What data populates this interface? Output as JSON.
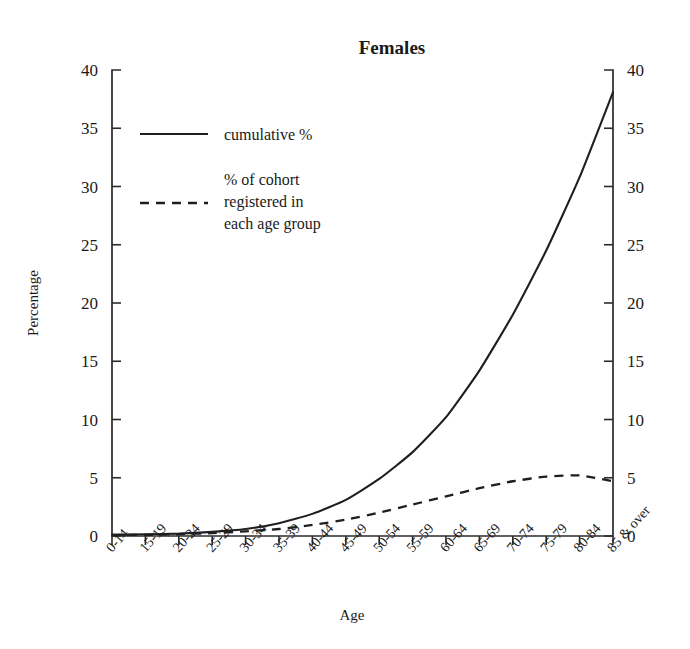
{
  "chart_data": {
    "type": "line",
    "title": "Females",
    "xlabel": "Age",
    "ylabel": "Percentage",
    "ylim": [
      0,
      40
    ],
    "yticks": [
      0,
      5,
      10,
      15,
      20,
      25,
      30,
      35,
      40
    ],
    "ytick_labels": [
      "0",
      "5",
      "10",
      "15",
      "20",
      "25",
      "30",
      "35",
      "40"
    ],
    "grid": false,
    "legend_position": "upper-left-inside",
    "dual_axis": true,
    "right_axis_label": "",
    "right_ytick_labels": [
      "0",
      "5",
      "10",
      "15",
      "20",
      "25",
      "30",
      "35",
      "40"
    ],
    "categories": [
      "0-14",
      "15-19",
      "20-24",
      "25-29",
      "30-34",
      "35-39",
      "40-44",
      "45-49",
      "50-54",
      "55-59",
      "60-64",
      "65-69",
      "70-74",
      "75-79",
      "80-84",
      "85 & over"
    ],
    "series": [
      {
        "name": "cumulative %",
        "style": "solid",
        "values": [
          0.1,
          0.15,
          0.2,
          0.35,
          0.6,
          1.1,
          1.9,
          3.1,
          4.9,
          7.2,
          10.2,
          14.2,
          19.0,
          24.5,
          30.8,
          38.1
        ]
      },
      {
        "name": "% of cohort registered in each age group",
        "style": "dashed",
        "values": [
          0.1,
          0.1,
          0.15,
          0.25,
          0.4,
          0.6,
          0.95,
          1.4,
          2.0,
          2.7,
          3.4,
          4.1,
          4.7,
          5.1,
          5.2,
          4.7
        ]
      }
    ]
  },
  "legend": {
    "entries": [
      {
        "label": "cumulative %",
        "style": "solid"
      },
      {
        "label": "% of cohort\nregistered in\neach age group",
        "style": "dashed"
      }
    ],
    "entry1_label": "cumulative %",
    "entry2_line1": "% of cohort",
    "entry2_line2": "registered in",
    "entry2_line3": "each age group"
  },
  "colors": {
    "line": "#1f1f1f",
    "axis": "#2b2b2b",
    "background": "#ffffff",
    "text": "#1a1a1a"
  }
}
